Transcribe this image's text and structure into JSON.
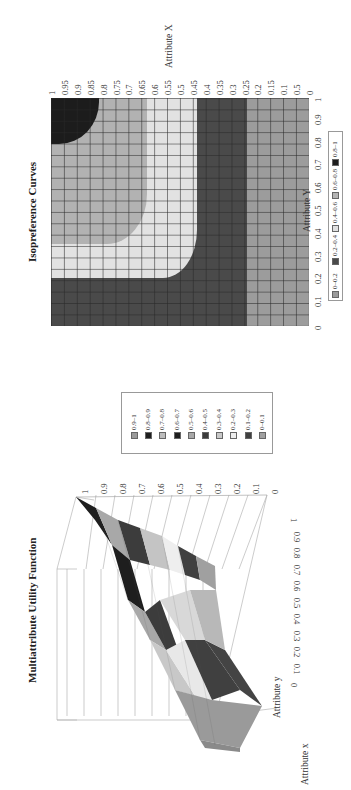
{
  "page": {
    "orientation": "rotated-90-ccw"
  },
  "chart_data": [
    {
      "type": "heatmap",
      "title": "Isopreference Curves",
      "xlabel": "Attribute Y",
      "ylabel": "Attribute X",
      "x_ticks": [
        "0",
        "0.1",
        "0.2",
        "0.3",
        "0.4",
        "0.5",
        "0.6",
        "0.7",
        "0.8",
        "0.9",
        "1"
      ],
      "y_ticks": [
        "1",
        "0.95",
        "0.9",
        "0.85",
        "0.8",
        "0.75",
        "0.7",
        "0.65",
        "0.6",
        "0.55",
        "0.5",
        "0.45",
        "0.4",
        "0.35",
        "0.3",
        "0.25",
        "0.2",
        "0.15",
        "0.1",
        "0.5",
        "0"
      ],
      "legend": [
        {
          "label": "0-0.2",
          "color": "#9a9a9a"
        },
        {
          "label": "0.2-0.4",
          "color": "#4a4a4a"
        },
        {
          "label": "0.4-0.6",
          "color": "#e0e0e0"
        },
        {
          "label": "0.6-0.8",
          "color": "#b4b4b4"
        },
        {
          "label": "0.8-1",
          "color": "#1e1e1e"
        }
      ],
      "legend_position": "bottom",
      "grid": true,
      "regions": [
        {
          "range": "0-0.2",
          "description": "outer band, Attribute X < ~0.2 or Attribute Y < ~0.15"
        },
        {
          "range": "0.2-0.4",
          "description": "band X ~0.2-0.4 / Y ~0.15-0.35"
        },
        {
          "range": "0.4-0.6",
          "description": "band X ~0.4-0.6 / Y ~0.35-0.55"
        },
        {
          "range": "0.6-0.8",
          "description": "band X ~0.6-0.8 / Y ~0.55-0.8"
        },
        {
          "range": "0.8-1",
          "description": "corner X > ~0.8 and Y > ~0.8"
        }
      ]
    },
    {
      "type": "surface",
      "title": "Multiattribute Utility Function",
      "xlabel": "Attribute x",
      "ylabel": "Attribute y",
      "zlabel": "",
      "z_ticks": [
        "0",
        "0.1",
        "0.2",
        "0.3",
        "0.4",
        "0.5",
        "0.6",
        "0.7",
        "0.8",
        "0.9",
        "1"
      ],
      "y_ticks": [
        "0",
        "0.1",
        "0.2",
        "0.3",
        "0.4",
        "0.5",
        "0.6",
        "0.7",
        "0.8",
        "0.9",
        "1"
      ],
      "zlim": [
        0,
        1
      ],
      "legend": [
        {
          "label": "0.9-1",
          "color": "#9a9a9a"
        },
        {
          "label": "0.8-0.9",
          "color": "#1e1e1e"
        },
        {
          "label": "0.7-0.8",
          "color": "#bdbdbd"
        },
        {
          "label": "0.6-0.7",
          "color": "#1e1e1e"
        },
        {
          "label": "0.5-0.6",
          "color": "#a8a8a8"
        },
        {
          "label": "0.4-0.5",
          "color": "#3c3c3c"
        },
        {
          "label": "0.3-0.4",
          "color": "#c8c8c8"
        },
        {
          "label": "0.2-0.3",
          "color": "#eeeeee"
        },
        {
          "label": "0.1-0.2",
          "color": "#404040"
        },
        {
          "label": "0-0.1",
          "color": "#a0a0a0"
        }
      ],
      "legend_position": "right"
    }
  ],
  "iso": {
    "title": "Isopreference Curves",
    "xlabel": "Attribute Y",
    "ylabel": "Attribute X",
    "legend": [
      "0-0.2",
      "0.2-0.4",
      "0.4-0.6",
      "0.6-0.8",
      "0.8-1"
    ]
  },
  "mau": {
    "title": "Multiattribute Utility Function",
    "xlabel": "Attribute x",
    "ylabel": "Attribute y",
    "legend": [
      "0.9-1",
      "0.8-0.9",
      "0.7-0.8",
      "0.6-0.7",
      "0.5-0.6",
      "0.4-0.5",
      "0.3-0.4",
      "0.2-0.3",
      "0.1-0.2",
      "0-0.1"
    ]
  }
}
